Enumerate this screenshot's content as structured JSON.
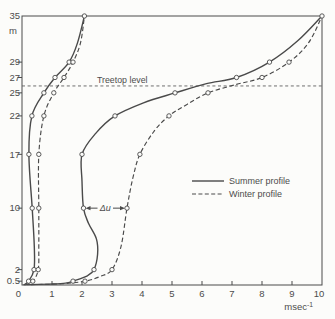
{
  "colors": {
    "ink": "#4a4a4a",
    "paper": "#fcfcfa",
    "annotation": "#5e5e5e"
  },
  "chart_data": {
    "type": "line",
    "title": "",
    "xlabel_unit": "msec",
    "xlabel_exponent": "-1",
    "ylabel_unit": "m",
    "origin_label": "0",
    "xlim": [
      0,
      10
    ],
    "ylim": [
      0,
      35
    ],
    "grid": false,
    "x_ticks": [
      0,
      1,
      2,
      3,
      4,
      5,
      6,
      7,
      8,
      9,
      10
    ],
    "y_ticks": [
      {
        "value": 35,
        "label": "35"
      },
      {
        "value": 29,
        "label": "29"
      },
      {
        "value": 27,
        "label": "27"
      },
      {
        "value": 25,
        "label": "25"
      },
      {
        "value": 22,
        "label": "22"
      },
      {
        "value": 17,
        "label": "17"
      },
      {
        "value": 10,
        "label": "10"
      },
      {
        "value": 2,
        "label": "2"
      },
      {
        "value": 0.5,
        "label": "0.5"
      }
    ],
    "legend_position": "center-right",
    "legend": [
      {
        "label": "Summer profile",
        "style": "solid"
      },
      {
        "label": "Winter profile",
        "style": "dashed"
      }
    ],
    "annotations": {
      "treetop": {
        "label": "Treetop level",
        "height": 25.9
      },
      "delta_u": {
        "label": "Δu",
        "height": 10,
        "from_x": 2.05,
        "to_x": 3.5
      }
    },
    "series": [
      {
        "id": "summer-profile-light-wind",
        "legend": "Summer profile",
        "style": "solid",
        "points": [
          [
            0.05,
            0,
            0
          ],
          [
            0.22,
            0.5,
            1
          ],
          [
            0.4,
            2,
            1
          ],
          [
            0.41,
            5,
            0
          ],
          [
            0.34,
            10,
            1
          ],
          [
            0.23,
            17,
            1
          ],
          [
            0.33,
            22,
            1
          ],
          [
            0.73,
            25,
            1
          ],
          [
            1.1,
            27,
            1
          ],
          [
            1.57,
            29,
            1
          ],
          [
            1.85,
            31.5,
            0
          ],
          [
            2.08,
            35,
            1
          ]
        ]
      },
      {
        "id": "winter-profile-light-wind",
        "legend": "Winter profile",
        "style": "dashed",
        "points": [
          [
            0.1,
            0,
            0
          ],
          [
            0.36,
            0.5,
            1
          ],
          [
            0.54,
            2,
            1
          ],
          [
            0.56,
            5,
            0
          ],
          [
            0.56,
            10,
            1
          ],
          [
            0.56,
            17,
            1
          ],
          [
            0.73,
            22,
            1
          ],
          [
            1.06,
            25,
            1
          ],
          [
            1.4,
            27,
            1
          ],
          [
            1.7,
            29,
            1
          ],
          [
            1.95,
            31.5,
            0
          ],
          [
            2.08,
            35,
            0
          ]
        ]
      },
      {
        "id": "summer-profile-strong-wind",
        "legend": "Summer profile",
        "style": "solid",
        "points": [
          [
            0.15,
            0.05,
            0
          ],
          [
            0.9,
            0.12,
            0
          ],
          [
            1.45,
            0.25,
            0
          ],
          [
            1.7,
            0.5,
            1
          ],
          [
            2.18,
            1.2,
            0
          ],
          [
            2.4,
            2,
            1
          ],
          [
            2.52,
            4,
            0
          ],
          [
            2.48,
            6,
            0
          ],
          [
            2.22,
            8,
            0
          ],
          [
            2.05,
            10,
            1
          ],
          [
            2.0,
            13.5,
            0
          ],
          [
            2.0,
            17,
            1
          ],
          [
            2.45,
            19.7,
            0
          ],
          [
            3.1,
            22,
            1
          ],
          [
            4.05,
            23.7,
            0
          ],
          [
            5.1,
            25,
            1
          ],
          [
            6.15,
            26.2,
            0
          ],
          [
            7.15,
            27,
            1
          ],
          [
            8.25,
            29,
            1
          ],
          [
            9.2,
            31.8,
            0
          ],
          [
            10,
            35,
            1
          ]
        ]
      },
      {
        "id": "winter-profile-strong-wind",
        "legend": "Winter profile",
        "style": "dashed",
        "points": [
          [
            0.3,
            0.05,
            0
          ],
          [
            1.3,
            0.15,
            0
          ],
          [
            2.1,
            0.5,
            1
          ],
          [
            2.6,
            1.1,
            0
          ],
          [
            3.0,
            2,
            1
          ],
          [
            3.3,
            5,
            0
          ],
          [
            3.5,
            10,
            1
          ],
          [
            3.7,
            14,
            0
          ],
          [
            3.93,
            17,
            1
          ],
          [
            4.4,
            20,
            0
          ],
          [
            4.9,
            22,
            1
          ],
          [
            5.5,
            23.5,
            0
          ],
          [
            6.2,
            25,
            1
          ],
          [
            7.15,
            26.1,
            0
          ],
          [
            8.0,
            27,
            1
          ],
          [
            8.9,
            29,
            1
          ],
          [
            9.55,
            31.5,
            0
          ],
          [
            10,
            35,
            0
          ]
        ]
      }
    ]
  }
}
